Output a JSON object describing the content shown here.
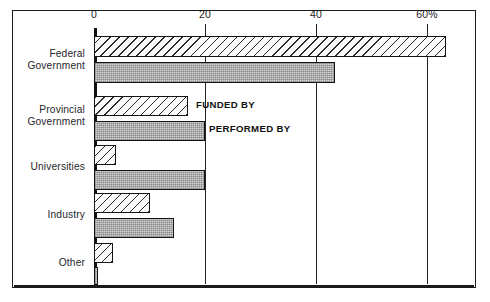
{
  "chart_data": {
    "type": "bar",
    "orientation": "horizontal",
    "title": "",
    "subtitle": "",
    "xlabel": "",
    "ylabel": "",
    "xlim": [
      0,
      68
    ],
    "grid": true,
    "legend_position": "in-plot annotations",
    "categories": [
      "Federal\nGovernment",
      "Provincial\nGovernment",
      "Universities",
      "Industry",
      "Other"
    ],
    "tick_labels": [
      "0",
      "20",
      "40",
      "60%"
    ],
    "tick_values": [
      0,
      20,
      40,
      60
    ],
    "series": [
      {
        "name": "FUNDED BY",
        "pattern": "diagonal-hatch",
        "values": [
          63.5,
          17.0,
          4.0,
          10.0,
          3.5
        ]
      },
      {
        "name": "PERFORMED BY",
        "pattern": "stipple-gray",
        "values": [
          43.5,
          20.0,
          20.0,
          14.5,
          0.7
        ]
      }
    ],
    "annotations": [
      {
        "text": "FUNDED BY"
      },
      {
        "text": "PERFORMED BY"
      }
    ]
  },
  "colors": {
    "frame": "#1a1a1a",
    "axis": "#121212",
    "gridline": "#23231f",
    "funded_fill": "#fbfbfa",
    "performed_fill": "#d6d6d6",
    "text": "#26262a"
  }
}
